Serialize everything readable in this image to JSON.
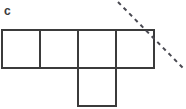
{
  "figure": {
    "panel_label": "c",
    "background_color": "#ffffff",
    "stroke_color": "#3b3b3b",
    "dash_color": "#4a4a52",
    "stroke_width": 2,
    "dash_width": 2,
    "dash_pattern": "4 4",
    "cell_size": 38
  },
  "grid": {
    "origin_x": 2,
    "origin_y": 30,
    "cell_size": 38,
    "top_row_count": 4,
    "cells": [
      {
        "name": "cell-top-1",
        "col": 0,
        "row": 0,
        "x": 2,
        "y": 30,
        "w": 38,
        "h": 38
      },
      {
        "name": "cell-top-2",
        "col": 1,
        "row": 0,
        "x": 40,
        "y": 30,
        "w": 38,
        "h": 38
      },
      {
        "name": "cell-top-3",
        "col": 2,
        "row": 0,
        "x": 78,
        "y": 30,
        "w": 38,
        "h": 38
      },
      {
        "name": "cell-top-4",
        "col": 3,
        "row": 0,
        "x": 116,
        "y": 30,
        "w": 38,
        "h": 38
      },
      {
        "name": "cell-bottom-1",
        "col": 2,
        "row": 1,
        "x": 78,
        "y": 68,
        "w": 38,
        "h": 38
      }
    ]
  },
  "symmetry_line": {
    "name": "dashed-symmetry-line",
    "x1": 118,
    "y1": 2,
    "x2": 183,
    "y2": 68,
    "style": "dashed",
    "color": "#4a4a52"
  }
}
